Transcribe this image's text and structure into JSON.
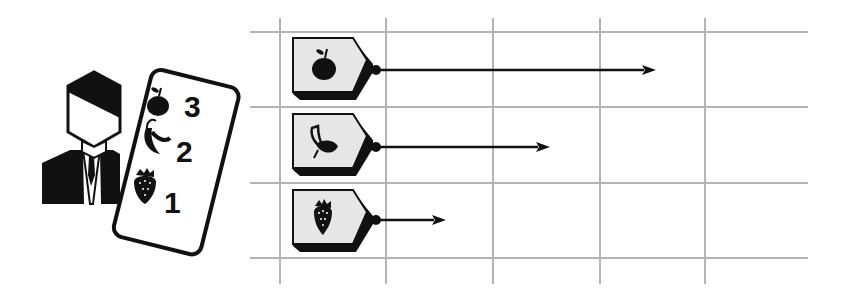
{
  "diagram": {
    "colors": {
      "grid": "#b3b3b3",
      "ink": "#111111",
      "tag_fill": "#e6e6e6",
      "background": "#ffffff"
    },
    "person": {
      "icon": "businessman-icon"
    },
    "card": {
      "icon": "ranking-card-icon",
      "rows": [
        {
          "fruit": "apple",
          "icon": "apple-icon",
          "rank": "3"
        },
        {
          "fruit": "banana",
          "icon": "banana-icon",
          "rank": "2"
        },
        {
          "fruit": "strawberry",
          "icon": "strawberry-icon",
          "rank": "1"
        }
      ]
    },
    "grid": {
      "columns": 5,
      "rows": 3
    },
    "bars": [
      {
        "fruit": "apple",
        "icon": "apple-icon",
        "value": 3,
        "arrow_end_x": 656
      },
      {
        "fruit": "banana",
        "icon": "banana-icon",
        "value": 2,
        "arrow_end_x": 550
      },
      {
        "fruit": "strawberry",
        "icon": "strawberry-icon",
        "value": 1,
        "arrow_end_x": 446
      }
    ]
  }
}
